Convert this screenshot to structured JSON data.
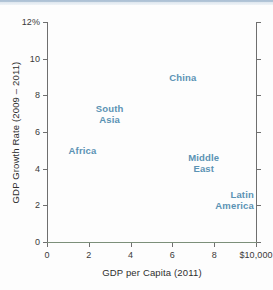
{
  "chart_data": {
    "type": "scatter",
    "title": "",
    "xlabel": "GDP per Capita (2011)",
    "ylabel": "GDP Growth Rate (2009 – 2011)",
    "xlim": [
      0,
      10
    ],
    "ylim": [
      0,
      12
    ],
    "grid": false,
    "legend": "none",
    "x_tick_labels": [
      "0",
      "2",
      "4",
      "6",
      "8",
      "$10,000"
    ],
    "x_tick_values": [
      0,
      2,
      4,
      6,
      8,
      10
    ],
    "y_tick_labels": [
      "0",
      "2",
      "4",
      "6",
      "8",
      "10",
      "12%"
    ],
    "y_tick_values": [
      0,
      2,
      4,
      6,
      8,
      10,
      12
    ],
    "x_units": "thousands of US dollars",
    "y_units": "percent",
    "marker_style": "text-label-only",
    "label_color": "#5b93b4",
    "points": [
      {
        "name": "China",
        "label": "China",
        "x": 6.5,
        "y": 9.0,
        "align": "center"
      },
      {
        "name": "South Asia",
        "label": "South\nAsia",
        "x": 3.0,
        "y": 7.0,
        "align": "center"
      },
      {
        "name": "Africa",
        "label": "Africa",
        "x": 1.7,
        "y": 5.0,
        "align": "center"
      },
      {
        "name": "Middle East",
        "label": "Middle\nEast",
        "x": 7.5,
        "y": 4.3,
        "align": "center"
      },
      {
        "name": "Latin America",
        "label": "Latin\nAmerica",
        "x": 9.9,
        "y": 2.3,
        "align": "right"
      }
    ]
  },
  "axes": {
    "x_title": "GDP per Capita (2011)",
    "y_title": "GDP Growth Rate (2009 – 2011)"
  },
  "colors": {
    "label": "#5b93b4",
    "axis": "#6f6f6f",
    "baseline": "#7c8f7a",
    "text": "#2e2e2e"
  }
}
